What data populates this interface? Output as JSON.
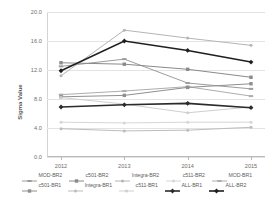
{
  "chart_data": {
    "type": "line",
    "title": "",
    "xlabel": "",
    "ylabel": "Sigma Value",
    "categories": [
      "2012",
      "2013",
      "2014",
      "2015"
    ],
    "ylim": [
      0.0,
      20.0
    ],
    "yticks": [
      "0.0",
      "4.0",
      "8.0",
      "12.0",
      "16.0",
      "20.0"
    ],
    "ytick_values": [
      0.0,
      4.0,
      8.0,
      12.0,
      16.0,
      20.0
    ],
    "grid": true,
    "legend_position": "bottom",
    "series": [
      {
        "name": "MOD-BR2",
        "values": [
          12.5,
          13.5,
          10.2,
          9.4
        ],
        "color": "#9c9c9c",
        "width": 1.0,
        "marker": "dash"
      },
      {
        "name": "c501-BR2",
        "values": [
          13.0,
          12.8,
          12.1,
          11.0
        ],
        "color": "#8a8a8a",
        "width": 1.0,
        "marker": "square"
      },
      {
        "name": "Integra-BR2",
        "values": [
          11.2,
          17.5,
          16.4,
          15.4
        ],
        "color": "#b5b5b5",
        "width": 1.0,
        "marker": "dot"
      },
      {
        "name": "c511-BR2",
        "values": [
          4.8,
          4.7,
          4.8,
          4.8
        ],
        "color": "#d6d6d6",
        "width": 1.0,
        "marker": "dot"
      },
      {
        "name": "MOD-BR1",
        "values": [
          8.6,
          9.1,
          9.7,
          8.4
        ],
        "color": "#adadad",
        "width": 1.0,
        "marker": "dash"
      },
      {
        "name": "c501-BR1",
        "values": [
          8.3,
          8.5,
          9.6,
          10.1
        ],
        "color": "#8f8f8f",
        "width": 1.0,
        "marker": "square"
      },
      {
        "name": "Integra-BR1",
        "values": [
          3.9,
          3.6,
          3.7,
          4.1
        ],
        "color": "#bdbdbd",
        "width": 1.0,
        "marker": "dot"
      },
      {
        "name": "c511-BR1",
        "values": [
          8.2,
          7.3,
          6.1,
          6.9
        ],
        "color": "#cfcfcf",
        "width": 1.0,
        "marker": "dot"
      },
      {
        "name": "ALL-BR1",
        "values": [
          6.9,
          7.2,
          7.4,
          6.8
        ],
        "color": "#2b2b2b",
        "width": 1.6,
        "marker": "diamond"
      },
      {
        "name": "ALL-BR2",
        "values": [
          11.9,
          16.0,
          14.7,
          13.1
        ],
        "color": "#1f1f1f",
        "width": 1.6,
        "marker": "diamond"
      }
    ]
  },
  "legend": {
    "rows": [
      [
        "MOD-BR2",
        "c501-BR2",
        "Integra-BR2",
        "c511-BR2",
        "MOD-BR1"
      ],
      [
        "c501-BR1",
        "Integra-BR1",
        "c511-BR1",
        "ALL-BR1",
        "ALL-BR2"
      ]
    ]
  }
}
